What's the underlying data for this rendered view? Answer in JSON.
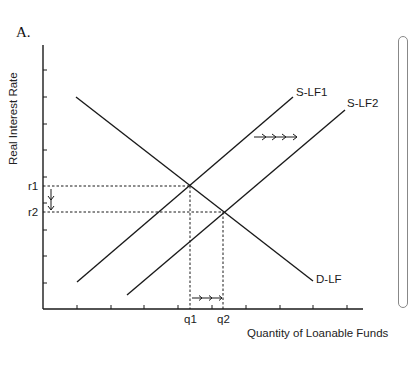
{
  "panel_label": "A.",
  "axes": {
    "ylabel": "Real Interest Rate",
    "xlabel": "Quantity of Loanable Funds",
    "y_ticks": [
      "r1",
      "r2"
    ],
    "x_ticks": [
      "q1",
      "q2"
    ]
  },
  "curves": {
    "supply1": "S-LF1",
    "supply2": "S-LF2",
    "demand": "D-LF"
  },
  "annotations": {
    "supply_shift": "rightward shift arrows (S-LF1 to S-LF2)",
    "rate_change": "downward arrow (r1 to r2)",
    "quantity_change": "rightward arrows (q1 to q2)"
  },
  "colors": {
    "line": "#1a1a1a",
    "background": "#ffffff"
  }
}
